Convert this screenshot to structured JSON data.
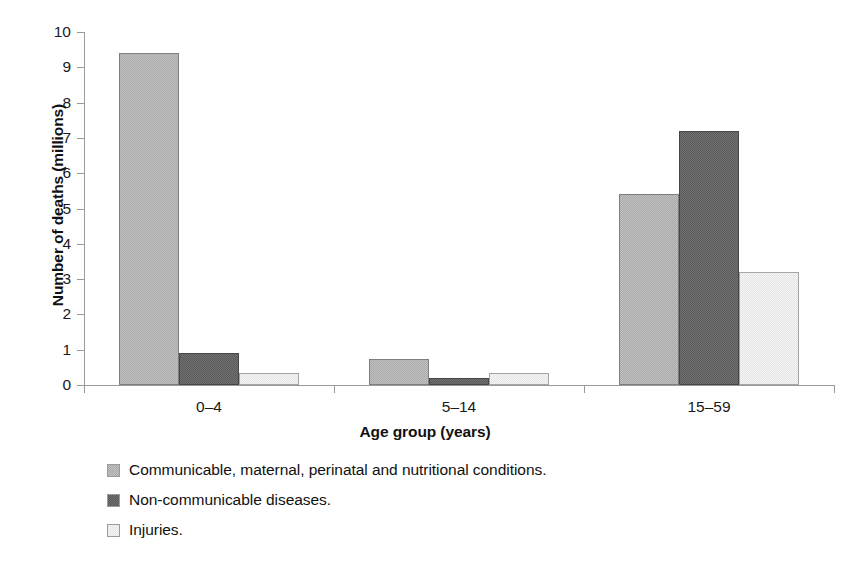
{
  "chart_data": {
    "type": "bar",
    "title": "",
    "xlabel": "Age group (years)",
    "ylabel": "Number of deaths (millions)",
    "categories": [
      "0–4",
      "5–14",
      "15–59"
    ],
    "ylim": [
      0,
      10
    ],
    "yticks": [
      "0",
      "1",
      "2",
      "3",
      "4",
      "5",
      "6",
      "7",
      "8",
      "9",
      "10"
    ],
    "grid": false,
    "legend_position": "below",
    "series": [
      {
        "name": "Communicable, maternal, perinatal and nutritional conditions.",
        "color": "#a9a9a9",
        "values": [
          9.4,
          0.75,
          5.4
        ]
      },
      {
        "name": "Non-communicable diseases.",
        "color": "#585858",
        "values": [
          0.9,
          0.2,
          7.2
        ]
      },
      {
        "name": "Injuries.",
        "color": "#e6e6e6",
        "values": [
          0.35,
          0.35,
          3.2
        ]
      }
    ]
  }
}
